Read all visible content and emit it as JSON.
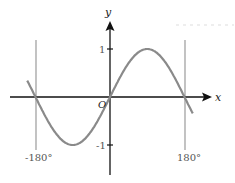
{
  "chart_data": {
    "type": "line",
    "title": "",
    "function": "y = sin x",
    "xlabel": "x",
    "ylabel": "y",
    "origin_label": "O",
    "xlim": [
      -270,
      270
    ],
    "ylim": [
      -1.6,
      1.6
    ],
    "x_tick_labels": [
      "-180°",
      "180°"
    ],
    "x_ticks": [
      -180,
      180
    ],
    "y_tick_labels": [
      "1",
      "-1"
    ],
    "y_ticks": [
      1,
      -1
    ],
    "vertical_lines": [
      -180,
      180
    ],
    "series": [
      {
        "name": "y = sin x",
        "x": [
          -200,
          -180,
          -135,
          -90,
          -45,
          0,
          45,
          90,
          135,
          180,
          200
        ],
        "values": [
          0.34,
          0,
          -0.71,
          -1,
          -0.71,
          0,
          0.71,
          1,
          0.71,
          0,
          -0.34
        ],
        "color": "#8a8a8a"
      }
    ],
    "grid": false,
    "legend": "none"
  },
  "colors": {
    "axis": "#111111",
    "curve": "#8a8a8a",
    "guide_lines": "#9a9a9a"
  }
}
